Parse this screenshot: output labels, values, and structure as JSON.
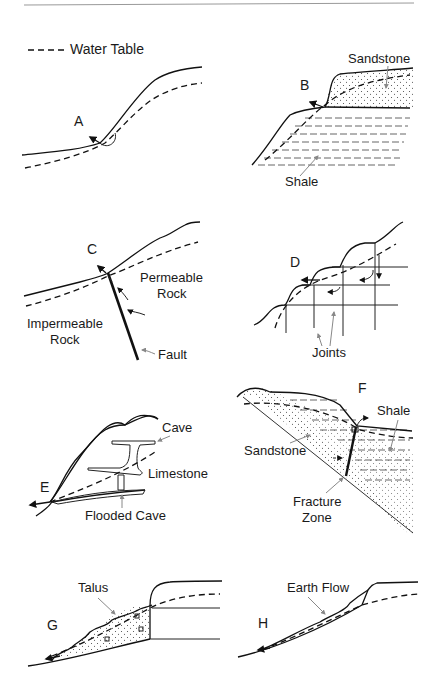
{
  "figure": {
    "legend": {
      "water_table_label": "Water Table"
    },
    "panels": [
      {
        "id": "A",
        "label": "A",
        "annotations": []
      },
      {
        "id": "B",
        "label": "B",
        "annotations": [
          "Sandstone",
          "Shale"
        ]
      },
      {
        "id": "C",
        "label": "C",
        "annotations": [
          "Permeable",
          "Rock",
          "Impermeable",
          "Rock",
          "Fault"
        ]
      },
      {
        "id": "D",
        "label": "D",
        "annotations": [
          "Joints"
        ]
      },
      {
        "id": "E",
        "label": "E",
        "annotations": [
          "Cave",
          "Limestone",
          "Flooded Cave"
        ]
      },
      {
        "id": "F",
        "label": "F",
        "annotations": [
          "Shale",
          "Sandstone",
          "Fracture",
          "Zone"
        ]
      },
      {
        "id": "G",
        "label": "G",
        "annotations": [
          "Talus"
        ]
      },
      {
        "id": "H",
        "label": "H",
        "annotations": [
          "Earth Flow"
        ]
      }
    ]
  }
}
